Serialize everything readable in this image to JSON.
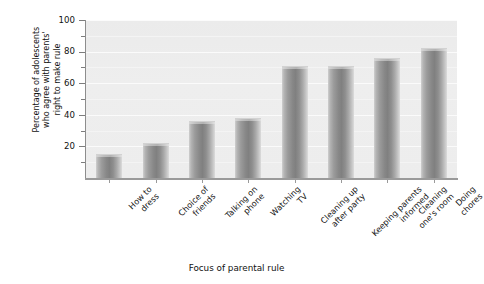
{
  "chart_data": {
    "type": "bar",
    "title": "",
    "xlabel": "Focus of parental rule",
    "ylabel": "Percentage of adolescents who agree with parents' right to make rule",
    "ylabel_lines": [
      "Percentage of adolescents",
      "who agree with parents'",
      "right to make rule"
    ],
    "categories": [
      "How to dress",
      "Choice of friends",
      "Talking on phone",
      "Watching TV",
      "Cleaning up after party",
      "Keeping parents informed",
      "Cleaning one's room",
      "Doing chores"
    ],
    "category_lines": [
      [
        "How to",
        "dress"
      ],
      [
        "Choice of",
        "friends"
      ],
      [
        "Talking on",
        "phone"
      ],
      [
        "Watching",
        "TV"
      ],
      [
        "Cleaning up",
        "after party"
      ],
      [
        "Keeping parents",
        "informed"
      ],
      [
        "Cleaning",
        "one's room"
      ],
      [
        "Doing",
        "chores"
      ]
    ],
    "values": [
      15,
      22,
      36,
      38,
      71,
      71,
      76,
      82
    ],
    "ylim": [
      0,
      100
    ],
    "ytick_labels": [
      "100",
      "80",
      "60",
      "40",
      "20"
    ],
    "ytick_values": [
      100,
      80,
      60,
      40,
      20
    ],
    "yminor_values": [
      90,
      70,
      50,
      30,
      10
    ],
    "grid": true,
    "legend": "none",
    "colors": {
      "plot_background": "#ededed",
      "bar_light": "#cfcfcf",
      "bar_dark": "#808080",
      "axis": "#8d8d8d",
      "gridline": "#fbfbfb",
      "text": "#111111",
      "page_background": "#ffffff"
    }
  }
}
